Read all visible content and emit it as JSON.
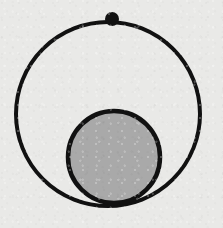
{
  "figure": {
    "width": 223,
    "height": 228,
    "background_color": "#e9e9e7",
    "stroke_color": "#111111"
  },
  "shapes": {
    "outer_circle": {
      "name": "outer circle",
      "cx": 108,
      "cy": 114,
      "r": 92,
      "fill": "none",
      "stroke": "#111111",
      "stroke_width": 4
    },
    "inner_circle": {
      "name": "inner shaded circle",
      "cx": 114,
      "cy": 157,
      "r": 46,
      "fill": "#a9a9a9",
      "stroke": "#111111",
      "stroke_width": 4.5
    },
    "marker_dot": {
      "name": "marker dot on outer circle",
      "cx": 112,
      "cy": 19,
      "r": 7,
      "fill": "#111111",
      "stroke": "none"
    }
  }
}
